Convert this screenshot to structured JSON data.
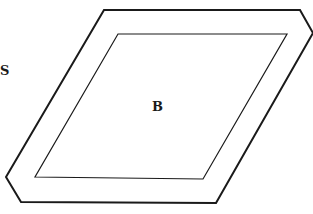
{
  "diagram": {
    "type": "nested-parallelogram",
    "outer_shape": {
      "name": "outer-hexagonal-parallelogram",
      "points": [
        [
          104,
          10
        ],
        [
          300,
          10
        ],
        [
          313,
          33
        ],
        [
          216,
          203
        ],
        [
          21,
          202
        ],
        [
          6,
          177
        ]
      ],
      "stroke": "#1a1a1a",
      "stroke_width": 2
    },
    "inner_shape": {
      "name": "inner-parallelogram",
      "points": [
        [
          118,
          34
        ],
        [
          287,
          34
        ],
        [
          203,
          179
        ],
        [
          35,
          177
        ]
      ],
      "stroke": "#1a1a1a",
      "stroke_width": 1.2
    },
    "labels": {
      "outer": "S",
      "inner": "B"
    }
  }
}
